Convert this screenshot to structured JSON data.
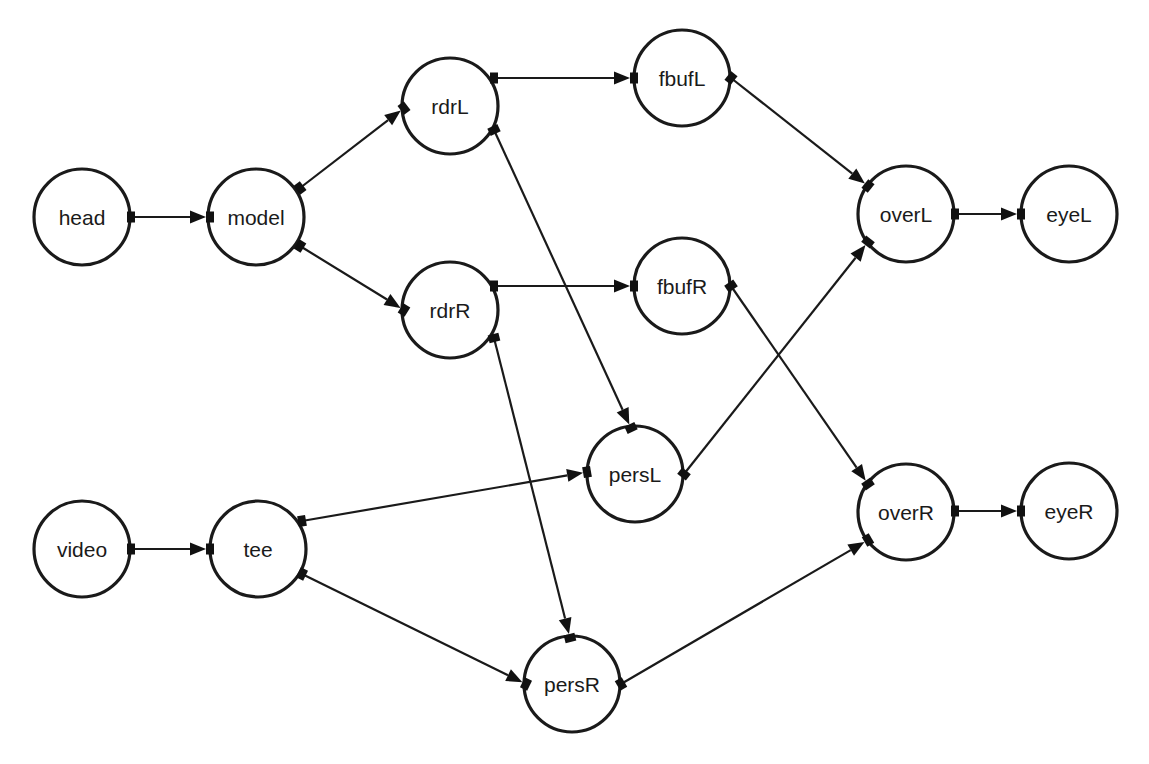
{
  "diagram": {
    "type": "dataflow-graph",
    "width": 1149,
    "height": 764,
    "background": "#ffffff",
    "stroke_color": "#1a1a1a",
    "node_radius": 48,
    "nodes": [
      {
        "id": "head",
        "label": "head",
        "cx": 82,
        "cy": 217
      },
      {
        "id": "model",
        "label": "model",
        "cx": 256,
        "cy": 217
      },
      {
        "id": "rdrL",
        "label": "rdrL",
        "cx": 450,
        "cy": 106
      },
      {
        "id": "rdrR",
        "label": "rdrR",
        "cx": 450,
        "cy": 310
      },
      {
        "id": "fbufL",
        "label": "fbufL",
        "cx": 682,
        "cy": 78
      },
      {
        "id": "fbufR",
        "label": "fbufR",
        "cx": 682,
        "cy": 286
      },
      {
        "id": "persL",
        "label": "persL",
        "cx": 635,
        "cy": 474
      },
      {
        "id": "persR",
        "label": "persR",
        "cx": 572,
        "cy": 684
      },
      {
        "id": "overL",
        "label": "overL",
        "cx": 906,
        "cy": 214
      },
      {
        "id": "overR",
        "label": "overR",
        "cx": 906,
        "cy": 512
      },
      {
        "id": "eyeL",
        "label": "eyeL",
        "cx": 1069,
        "cy": 214
      },
      {
        "id": "eyeR",
        "label": "eyeR",
        "cx": 1069,
        "cy": 511
      },
      {
        "id": "video",
        "label": "video",
        "cx": 82,
        "cy": 549
      },
      {
        "id": "tee",
        "label": "tee",
        "cx": 258,
        "cy": 549
      }
    ],
    "edges": [
      {
        "from": "head",
        "to": "model",
        "x1": 131,
        "y1": 217,
        "x2": 210,
        "y2": 217
      },
      {
        "from": "model",
        "to": "rdrL",
        "x1": 300,
        "y1": 188,
        "x2": 404,
        "y2": 108
      },
      {
        "from": "model",
        "to": "rdrR",
        "x1": 300,
        "y1": 246,
        "x2": 404,
        "y2": 310
      },
      {
        "from": "rdrL",
        "to": "fbufL",
        "x1": 494,
        "y1": 78,
        "x2": 634,
        "y2": 78
      },
      {
        "from": "rdrL",
        "to": "persL",
        "x1": 494,
        "y1": 130,
        "x2": 631,
        "y2": 428
      },
      {
        "from": "rdrR",
        "to": "fbufR",
        "x1": 494,
        "y1": 286,
        "x2": 634,
        "y2": 286
      },
      {
        "from": "rdrR",
        "to": "persR",
        "x1": 494,
        "y1": 338,
        "x2": 570,
        "y2": 638
      },
      {
        "from": "fbufL",
        "to": "overL",
        "x1": 731,
        "y1": 78,
        "x2": 868,
        "y2": 186
      },
      {
        "from": "fbufR",
        "to": "overR",
        "x1": 731,
        "y1": 286,
        "x2": 868,
        "y2": 484
      },
      {
        "from": "persL",
        "to": "overL",
        "x1": 684,
        "y1": 474,
        "x2": 868,
        "y2": 242
      },
      {
        "from": "persR",
        "to": "overR",
        "x1": 621,
        "y1": 684,
        "x2": 868,
        "y2": 540
      },
      {
        "from": "overL",
        "to": "eyeL",
        "x1": 955,
        "y1": 214,
        "x2": 1021,
        "y2": 214
      },
      {
        "from": "overR",
        "to": "eyeR",
        "x1": 955,
        "y1": 511,
        "x2": 1021,
        "y2": 511
      },
      {
        "from": "video",
        "to": "tee",
        "x1": 131,
        "y1": 549,
        "x2": 210,
        "y2": 549
      },
      {
        "from": "tee",
        "to": "persL",
        "x1": 302,
        "y1": 521,
        "x2": 587,
        "y2": 472
      },
      {
        "from": "tee",
        "to": "persR",
        "x1": 302,
        "y1": 574,
        "x2": 526,
        "y2": 684
      }
    ]
  }
}
